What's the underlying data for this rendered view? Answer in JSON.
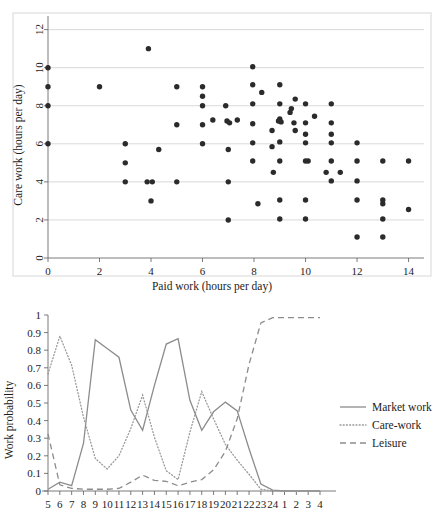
{
  "figure": {
    "panels": [
      "scatter-panel",
      "line-panel"
    ]
  },
  "chart_data": [
    {
      "id": "scatter",
      "type": "scatter",
      "title": "",
      "xlabel": "Paid work (hours per day)",
      "ylabel": "Care work (hours per day)",
      "xlim": [
        0,
        14.6
      ],
      "ylim": [
        0,
        12.4
      ],
      "xticks": [
        0,
        2,
        4,
        6,
        8,
        10,
        12,
        14
      ],
      "yticks": [
        0,
        2,
        4,
        6,
        8,
        10,
        12
      ],
      "grid": "horizontal",
      "legend": "none",
      "marker": "filled-circle",
      "points": [
        [
          0,
          10
        ],
        [
          0,
          9
        ],
        [
          0,
          8
        ],
        [
          0,
          6
        ],
        [
          2,
          9
        ],
        [
          3,
          6
        ],
        [
          3,
          5
        ],
        [
          3,
          4
        ],
        [
          3.9,
          11
        ],
        [
          3.85,
          4
        ],
        [
          4.05,
          4
        ],
        [
          4.0,
          3
        ],
        [
          4.3,
          5.7
        ],
        [
          5,
          9
        ],
        [
          5,
          7
        ],
        [
          5,
          4
        ],
        [
          6,
          9
        ],
        [
          6,
          8.5
        ],
        [
          6,
          8
        ],
        [
          6,
          7
        ],
        [
          6,
          6
        ],
        [
          6.4,
          7.25
        ],
        [
          6.9,
          8
        ],
        [
          6.95,
          7.2
        ],
        [
          7.05,
          7.1
        ],
        [
          7,
          5.7
        ],
        [
          7,
          4
        ],
        [
          7,
          2
        ],
        [
          7.35,
          7.25
        ],
        [
          7.95,
          10.05
        ],
        [
          7.95,
          9.1
        ],
        [
          7.95,
          8.1
        ],
        [
          7.95,
          7.05
        ],
        [
          7.95,
          6.05
        ],
        [
          7.95,
          5.1
        ],
        [
          8.15,
          2.85
        ],
        [
          8.3,
          8.7
        ],
        [
          8.7,
          6.7
        ],
        [
          8.7,
          5.85
        ],
        [
          8.75,
          4.5
        ],
        [
          9,
          9.1
        ],
        [
          9,
          8.1
        ],
        [
          9,
          7.3
        ],
        [
          8.95,
          7.2
        ],
        [
          9.05,
          7.15
        ],
        [
          9,
          6.1
        ],
        [
          9,
          5.1
        ],
        [
          9,
          3.05
        ],
        [
          9,
          2.05
        ],
        [
          9.45,
          7.85
        ],
        [
          9.4,
          7.65
        ],
        [
          9.6,
          8.35
        ],
        [
          9.55,
          7.1
        ],
        [
          9.6,
          6.7
        ],
        [
          10,
          8.1
        ],
        [
          10,
          7.1
        ],
        [
          10,
          6.5
        ],
        [
          10,
          6.05
        ],
        [
          10,
          5.1
        ],
        [
          10.1,
          5.1
        ],
        [
          10,
          3.05
        ],
        [
          10,
          2.05
        ],
        [
          10.35,
          7.45
        ],
        [
          10.8,
          4.5
        ],
        [
          11,
          8.1
        ],
        [
          11,
          7.1
        ],
        [
          11,
          6.5
        ],
        [
          11,
          6.05
        ],
        [
          11,
          5.1
        ],
        [
          11,
          4.05
        ],
        [
          11.35,
          4.5
        ],
        [
          12,
          6.05
        ],
        [
          12,
          5.1
        ],
        [
          12,
          4.05
        ],
        [
          12,
          3.05
        ],
        [
          12,
          1.1
        ],
        [
          13,
          5.1
        ],
        [
          13,
          3.05
        ],
        [
          13,
          2.85
        ],
        [
          13,
          2.05
        ],
        [
          13,
          1.1
        ],
        [
          14,
          5.1
        ],
        [
          14,
          2.55
        ]
      ]
    },
    {
      "id": "work-probability",
      "type": "line",
      "title": "",
      "xlabel": "",
      "ylabel": "Work probability",
      "ylim": [
        0,
        1
      ],
      "yticks": [
        0,
        0.1,
        0.2,
        0.3,
        0.4,
        0.5,
        0.6,
        0.7,
        0.8,
        0.9,
        1
      ],
      "ytick_labels": [
        "0",
        "0.1",
        "0.2",
        "0.3",
        "0.4",
        "0.5",
        "0.6",
        "0.7",
        "0.8",
        "0.9",
        "1"
      ],
      "xticks": [
        5,
        6,
        7,
        8,
        9,
        10,
        11,
        12,
        13,
        14,
        15,
        16,
        17,
        18,
        19,
        20,
        21,
        22,
        23,
        24,
        1,
        2,
        3,
        4
      ],
      "xtick_labels": [
        "5",
        "6",
        "7",
        "8",
        "9",
        "10",
        "11",
        "12",
        "13",
        "14",
        "15",
        "16",
        "17",
        "18",
        "19",
        "20",
        "21",
        "22",
        "23",
        "24",
        "1",
        "2",
        "3",
        "4"
      ],
      "grid": "none",
      "legend_position": "right",
      "series": [
        {
          "name": "Market work",
          "style": "solid",
          "color": "#8c8c8c",
          "values": [
            0.01,
            0.05,
            0.03,
            0.27,
            0.86,
            0.81,
            0.76,
            0.46,
            0.345,
            0.6,
            0.835,
            0.865,
            0.515,
            0.345,
            0.45,
            0.505,
            0.455,
            0.24,
            0.04,
            0.005,
            0.0,
            0.0,
            0.0,
            0.0
          ]
        },
        {
          "name": "Care-work",
          "style": "dotted",
          "color": "#9a9a9a",
          "values": [
            0.665,
            0.88,
            0.715,
            0.42,
            0.185,
            0.125,
            0.2,
            0.355,
            0.545,
            0.305,
            0.115,
            0.065,
            0.335,
            0.565,
            0.41,
            0.265,
            0.175,
            0.095,
            0.01,
            0.0,
            0.0,
            0.0,
            0.0,
            0.0
          ]
        },
        {
          "name": "Leisure",
          "style": "dashed",
          "color": "#8c8c8c",
          "values": [
            0.325,
            0.035,
            0.015,
            0.01,
            0.01,
            0.01,
            0.015,
            0.05,
            0.09,
            0.06,
            0.055,
            0.03,
            0.05,
            0.065,
            0.12,
            0.225,
            0.41,
            0.72,
            0.955,
            0.985,
            0.985,
            0.985,
            0.985,
            0.985
          ]
        }
      ]
    }
  ]
}
